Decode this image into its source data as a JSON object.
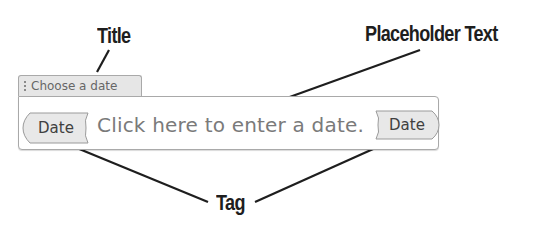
{
  "callouts": {
    "title": "Title",
    "placeholder": "Placeholder Text",
    "tag": "Tag"
  },
  "content_control": {
    "title_tab": {
      "label": "Choose a date",
      "grip_icon": "vertical-dots-grip-icon"
    },
    "start_tag": "Date",
    "placeholder_text": "Click here to enter a date.",
    "end_tag": "Date"
  },
  "colors": {
    "callout_text": "#1e1e1e",
    "leader_line": "#1e1e1e",
    "tab_background": "#e6e6e6",
    "border": "#a9a9a9",
    "tag_background": "#e8e8e8",
    "placeholder_text": "#7a7a7a"
  }
}
